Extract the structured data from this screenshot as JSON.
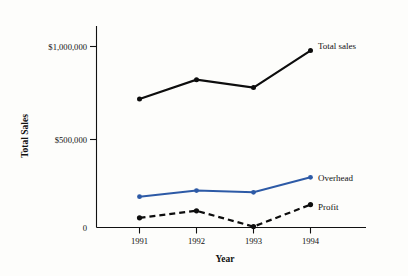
{
  "chart_data": {
    "type": "line",
    "title": "",
    "xlabel": "Year",
    "ylabel": "Total Sales",
    "categories": [
      "1991",
      "1992",
      "1993",
      "1994"
    ],
    "x": [
      1991,
      1992,
      1993,
      1994
    ],
    "series": [
      {
        "name": "Total sales",
        "color": "#0d0d0d",
        "style": "solid",
        "values": [
          730000,
          840000,
          795000,
          1005000
        ]
      },
      {
        "name": "Overhead",
        "color": "#2d5aa6",
        "style": "solid",
        "values": [
          175000,
          210000,
          200000,
          285000
        ]
      },
      {
        "name": "Profit",
        "color": "#0d0d0d",
        "style": "dashed",
        "values": [
          55000,
          95000,
          5000,
          130000
        ]
      }
    ],
    "ylim": [
      0,
      1120000
    ],
    "yticks": [
      0,
      500000,
      1000000
    ],
    "ytick_labels": [
      "0",
      "$500,000",
      "$1,000,000"
    ],
    "xtick_labels": [
      "1991",
      "1992",
      "1993",
      "1994"
    ],
    "grid": false,
    "legend_position": "right-inline-annotations",
    "annotations": [
      {
        "text": "Total sales",
        "series": "Total sales"
      },
      {
        "text": "Overhead",
        "series": "Overhead"
      },
      {
        "text": "Profit",
        "series": "Profit"
      }
    ]
  },
  "axes": {
    "y_title": "Total Sales",
    "x_title": "Year",
    "y_tick_0": "0",
    "y_tick_500k": "$500,000",
    "y_tick_1m": "$1,000,000",
    "x_tick_1991": "1991",
    "x_tick_1992": "1992",
    "x_tick_1993": "1993",
    "x_tick_1994": "1994"
  },
  "labels": {
    "total_sales": "Total sales",
    "overhead": "Overhead",
    "profit": "Profit"
  },
  "colors": {
    "overhead_blue": "#2d5aa6",
    "ink_black": "#0d0d0d",
    "paper": "#fdfdfb"
  }
}
